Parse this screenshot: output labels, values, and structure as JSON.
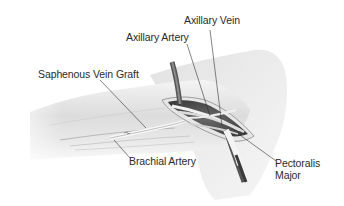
{
  "diagram": {
    "labels": {
      "axillary_vein": "Axillary Vein",
      "axillary_artery": "Axillary Artery",
      "saphenous_vein_graft": "Saphenous Vein Graft",
      "brachial_artery": "Brachial Artery",
      "pectoralis_major_line1": "Pectoralis",
      "pectoralis_major_line2": "Major"
    },
    "colors": {
      "background": "#ffffff",
      "skin_light": "#f0f0f0",
      "skin_mid": "#d6d6d6",
      "skin_shadow": "#a8a8a8",
      "incision_dark": "#4a4a4a",
      "leader_line": "#333333",
      "text": "#2a2a2a"
    }
  }
}
